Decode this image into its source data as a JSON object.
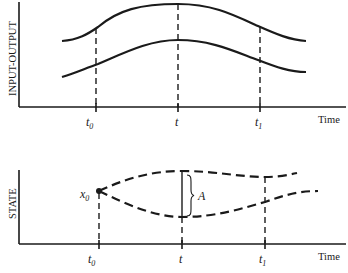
{
  "top_panel": {
    "y_label": "INPUT-OUTPUT",
    "x_label": "Time",
    "ticks": [
      {
        "symbol": "t",
        "subscript": "0"
      },
      {
        "symbol": "t",
        "subscript": ""
      },
      {
        "symbol": "t",
        "subscript": "1"
      }
    ],
    "curves": [
      "upper input-output curve",
      "lower input-output curve"
    ]
  },
  "bottom_panel": {
    "y_label": "STATE",
    "x_label": "Time",
    "ticks": [
      {
        "symbol": "t",
        "subscript": "0"
      },
      {
        "symbol": "t",
        "subscript": ""
      },
      {
        "symbol": "t",
        "subscript": "1"
      }
    ],
    "initial_state": {
      "symbol": "x",
      "subscript": "0"
    },
    "gap_label": "A",
    "curves": [
      "upper state trajectory (dashed)",
      "lower state trajectory (dashed)"
    ]
  },
  "colors": {
    "ink": "#1a1a1a",
    "background": "#ffffff"
  }
}
